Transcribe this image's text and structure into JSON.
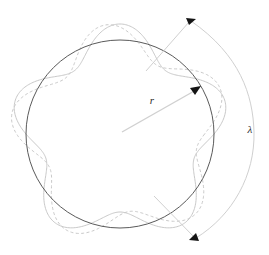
{
  "figure": {
    "width": 269,
    "height": 255,
    "background_color": "#ffffff"
  },
  "labels": {
    "radius": {
      "text": "r",
      "x": 152,
      "y": 104,
      "font_size": 11,
      "color": "#2b2b2b"
    },
    "wavelength": {
      "text": "λ",
      "x": 250,
      "y": 133,
      "font_size": 11,
      "color": "#2b2b2b"
    }
  },
  "colors": {
    "orbit_circle": "#5a5a5a",
    "wave_solid": "#c9c9c9",
    "wave_dashed": "#c9c9c9",
    "radius_line": "#d0d0d0",
    "bracket_line": "#d0d0d0",
    "arrowhead": "#141414",
    "background": "#ffffff"
  },
  "geometry": {
    "center": {
      "x": 120,
      "y": 134
    },
    "orbit_radius": 94,
    "wave_lobes": 5,
    "wave_amplitude": 16,
    "solid_wave_phase_deg": 90,
    "dashed_wave_phase_deg": 126,
    "radius_line": {
      "x1": 122,
      "y1": 132,
      "x2": 199,
      "y2": 88
    },
    "bracket_arc": {
      "cx": 120,
      "cy": 134,
      "rx": 132,
      "ry": 118,
      "start_deg": -68,
      "end_deg": 68
    }
  },
  "elements": {
    "orbit_circle_name": "orbit-circle",
    "wave_solid_name": "standing-wave-solid",
    "wave_dashed_name": "standing-wave-dashed",
    "radius_arrow_name": "radius-arrow",
    "wavelength_bracket_name": "wavelength-bracket"
  },
  "chart_data": {
    "type": "line",
    "xlabel": "",
    "ylabel": "",
    "polar": true,
    "series": [
      {
        "name": "orbit-circle",
        "style": "solid",
        "color": "#5a5a5a",
        "r_const": 94,
        "lobes": 0,
        "amplitude": 0
      },
      {
        "name": "standing-wave-solid",
        "style": "solid",
        "color": "#c9c9c9",
        "r_const": 94,
        "lobes": 5,
        "amplitude": 16,
        "phase_deg": 90
      },
      {
        "name": "standing-wave-dashed",
        "style": "dashed",
        "color": "#c9c9c9",
        "r_const": 94,
        "lobes": 5,
        "amplitude": 16,
        "phase_deg": 126
      }
    ],
    "annotations": [
      {
        "text": "r",
        "kind": "radius-arrow",
        "from": [
          120,
          134
        ],
        "to": [
          199,
          88
        ]
      },
      {
        "text": "λ",
        "kind": "bracket",
        "from": [
          190,
          20
        ],
        "to": [
          195,
          239
        ]
      }
    ]
  }
}
